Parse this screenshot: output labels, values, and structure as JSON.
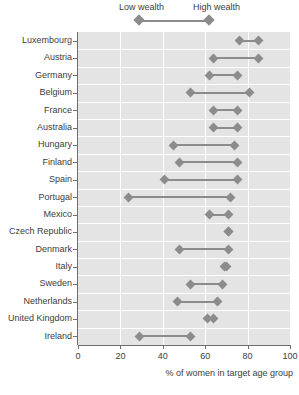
{
  "legend": {
    "low_label": "Low wealth",
    "high_label": "High wealth"
  },
  "axis": {
    "x_title": "% of women in target age group",
    "x_ticks": [
      "0",
      "20",
      "40",
      "60",
      "80",
      "100"
    ]
  },
  "colors": {
    "panel": "#e4e4e4",
    "grid": "#ffffff",
    "marker": "#8c8c8c",
    "text": "#3c3c3c",
    "axis": "#6e6e6e"
  },
  "chart_data": {
    "type": "scatter",
    "subtype": "dumbbell",
    "title": "",
    "xlabel": "% of women in target age group",
    "ylabel": "",
    "xlim": [
      0,
      100
    ],
    "xticks": [
      0,
      20,
      40,
      60,
      80,
      100
    ],
    "grid": true,
    "legend_position": "top",
    "series": [
      {
        "name": "Low wealth",
        "marker": "diamond",
        "color": "#8c8c8c"
      },
      {
        "name": "High wealth",
        "marker": "diamond",
        "color": "#8c8c8c"
      }
    ],
    "categories": [
      "Luxembourg",
      "Austria",
      "Germany",
      "Belgium",
      "France",
      "Australia",
      "Hungary",
      "Finland",
      "Spain",
      "Portugal",
      "Mexico",
      "Czech Republic",
      "Denmark",
      "Italy",
      "Sweden",
      "Netherlands",
      "United Kingdom",
      "Ireland"
    ],
    "points": [
      {
        "category": "Luxembourg",
        "low": 76,
        "high": 85
      },
      {
        "category": "Austria",
        "low": 64,
        "high": 85
      },
      {
        "category": "Germany",
        "low": 62,
        "high": 75
      },
      {
        "category": "Belgium",
        "low": 53,
        "high": 81
      },
      {
        "category": "France",
        "low": 64,
        "high": 75
      },
      {
        "category": "Australia",
        "low": 64,
        "high": 75
      },
      {
        "category": "Hungary",
        "low": 45,
        "high": 74
      },
      {
        "category": "Finland",
        "low": 48,
        "high": 75
      },
      {
        "category": "Spain",
        "low": 41,
        "high": 75
      },
      {
        "category": "Portugal",
        "low": 24,
        "high": 72
      },
      {
        "category": "Mexico",
        "low": 62,
        "high": 71
      },
      {
        "category": "Czech Republic",
        "low": 71,
        "high": 71
      },
      {
        "category": "Denmark",
        "low": 48,
        "high": 71
      },
      {
        "category": "Italy",
        "low": 69,
        "high": 70
      },
      {
        "category": "Sweden",
        "low": 53,
        "high": 68
      },
      {
        "category": "Netherlands",
        "low": 47,
        "high": 66
      },
      {
        "category": "United Kingdom",
        "low": 61,
        "high": 64
      },
      {
        "category": "Ireland",
        "low": 29,
        "high": 53
      }
    ]
  }
}
